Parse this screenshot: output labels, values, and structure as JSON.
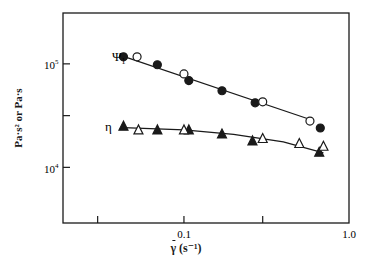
{
  "chart_data": {
    "type": "scatter",
    "title": "",
    "xlabel": "γ̇ (s⁻¹)",
    "ylabel": "Pa·s² or Pa·s",
    "xscale": "log",
    "yscale": "log",
    "xlim": [
      0.0185,
      1.0
    ],
    "ylim": [
      2900,
      310000
    ],
    "grid": false,
    "x_ticks": [
      {
        "value": 0.03,
        "label": ""
      },
      {
        "value": 0.1,
        "label": "0.1"
      },
      {
        "value": 0.3,
        "label": ""
      },
      {
        "value": 1.0,
        "label": "1.0"
      }
    ],
    "y_ticks": [
      {
        "value": 10000,
        "label": "10^4"
      },
      {
        "value": 31600,
        "label": ""
      },
      {
        "value": 100000,
        "label": "10^5"
      }
    ],
    "annotations": [
      {
        "text": "Ψ1",
        "near": "upper series"
      },
      {
        "text": "η",
        "near": "lower series"
      }
    ],
    "series": [
      {
        "name": "Ψ1 (filled circles)",
        "marker": "circle-filled",
        "x": [
          0.043,
          0.069,
          0.107,
          0.17,
          0.27,
          0.67
        ],
        "y": [
          117000,
          98000,
          69000,
          55000,
          42000,
          24000
        ]
      },
      {
        "name": "Ψ1 (open circles)",
        "marker": "circle-open",
        "x": [
          0.052,
          0.1,
          0.3,
          0.58
        ],
        "y": [
          117000,
          80000,
          43000,
          28000
        ]
      },
      {
        "name": "η (filled triangles)",
        "marker": "triangle-filled",
        "x": [
          0.043,
          0.069,
          0.107,
          0.17,
          0.26,
          0.66
        ],
        "y": [
          25000,
          23000,
          23000,
          21000,
          18000,
          14000
        ]
      },
      {
        "name": "η (open triangles)",
        "marker": "triangle-open",
        "x": [
          0.053,
          0.1,
          0.3,
          0.5,
          0.7
        ],
        "y": [
          23000,
          23000,
          19000,
          17000,
          16000
        ]
      }
    ],
    "fit_lines": [
      {
        "name": "Ψ1 fit",
        "shape": "straight",
        "x": [
          0.043,
          0.6
        ],
        "y": [
          118000,
          28500
        ]
      },
      {
        "name": "η fit",
        "shape": "curve",
        "x": [
          0.043,
          0.1,
          0.2,
          0.4,
          0.7
        ],
        "y": [
          24200,
          23000,
          20800,
          17600,
          13800
        ]
      }
    ]
  },
  "labels": {
    "psi1": "Ψ",
    "psi1_sub": "1",
    "eta": "η",
    "ytick_1e5_base": "10",
    "ytick_1e5_exp": "5",
    "ytick_1e4_base": "10",
    "ytick_1e4_exp": "4",
    "xtick_01": "0.1",
    "xtick_10": "1.0",
    "ylabel": "Pa·s² or Pa·s",
    "xlabel_symbol": "γ",
    "xlabel_unit": " (s⁻¹)"
  },
  "colors": {
    "ink": "#1a1a1a",
    "background": "#ffffff"
  }
}
